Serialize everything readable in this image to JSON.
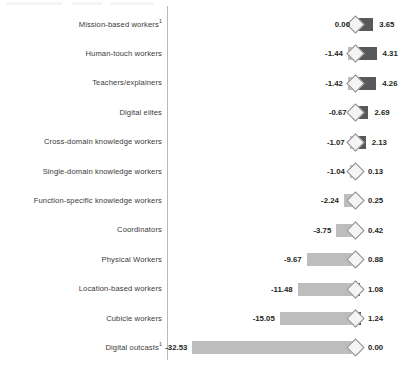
{
  "chart_data": {
    "type": "bar",
    "title": "",
    "subtitle": "",
    "xlabel": "",
    "ylabel": "",
    "orientation": "horizontal",
    "style": "diverging-stacked-bar-with-diamond-marker",
    "grid": false,
    "legend": null,
    "axis_zero": 0,
    "xlim": [
      -32.53,
      4.31
    ],
    "categories": [
      "Mission-based workers",
      "Human-touch workers",
      "Teachers/explainers",
      "Digital elites",
      "Cross-domain knowledge workers",
      "Single-domain knowledge workers",
      "Function-specific knowledge workers",
      "Coordinators",
      "Physical Workers",
      "Location-based workers",
      "Cubicle workers",
      "Digital outcasts"
    ],
    "category_footnotes": [
      1,
      null,
      null,
      null,
      null,
      null,
      null,
      null,
      null,
      null,
      null,
      1
    ],
    "series": [
      {
        "name": "negative",
        "values": [
          0.0,
          -1.44,
          -1.42,
          -0.67,
          -1.07,
          -1.04,
          -2.24,
          -3.75,
          -9.67,
          -11.48,
          -15.05,
          -32.53
        ]
      },
      {
        "name": "positive",
        "values": [
          3.65,
          4.31,
          4.26,
          2.69,
          2.13,
          0.13,
          0.25,
          0.42,
          0.88,
          1.08,
          1.24,
          0.0
        ]
      }
    ],
    "left_labels": [
      "0.00",
      "-1.44",
      "-1.42",
      "-0.67",
      "-1.07",
      "-1.04",
      "-2.24",
      "-3.75",
      "-9.67",
      "-11.48",
      "-15.05",
      "-32.53"
    ],
    "right_labels": [
      "3.65",
      "4.31",
      "4.26",
      "2.69",
      "2.13",
      "0.13",
      "0.25",
      "0.42",
      "0.88",
      "1.08",
      "1.24",
      "0.00"
    ],
    "colors": {
      "negative_bar": "#bdbdbd",
      "positive_bar": "#59595b",
      "marker": "#f4f4f4",
      "marker_outline": "#8d8d8d",
      "axis_divider": "#b9b9b9",
      "label_text": "#3a3a3a",
      "value_text": "#231f20",
      "background": "#ffffff"
    }
  }
}
